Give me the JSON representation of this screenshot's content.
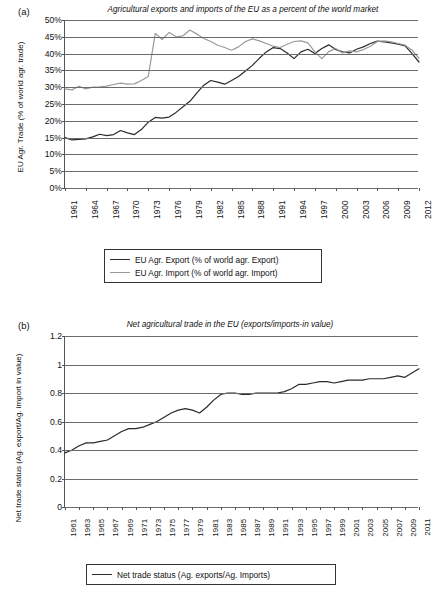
{
  "figure": {
    "panel_a_letter": "(a)",
    "panel_b_letter": "(b)"
  },
  "colors": {
    "export_line": "#2b2b2b",
    "import_line": "#9a9a9a",
    "net_line": "#2b2b2b",
    "grid": "#6b6b6b",
    "axis": "#555555",
    "text": "#111111"
  },
  "panel_a": {
    "title": "Agricultural exports and imports of the EU as a percent of the world market",
    "ylabel": "EU Agr. Trade (% of world agr. trade)",
    "yticks": [
      "50%",
      "45%",
      "40%",
      "35%",
      "30%",
      "25%",
      "20%",
      "15%",
      "10%",
      "5%",
      "0%"
    ],
    "xticks": [
      "1961",
      "1964",
      "1967",
      "1970",
      "1973",
      "1976",
      "1979",
      "1982",
      "1985",
      "1988",
      "1991",
      "1994",
      "1997",
      "2000",
      "2003",
      "2006",
      "2009",
      "2012"
    ],
    "legend": [
      {
        "label": "EU Agr. Export (% of world agr. Export)",
        "style": "dark"
      },
      {
        "label": "EU Agr. Import (% of world agr. Import)",
        "style": "light"
      }
    ]
  },
  "panel_b": {
    "title": "Net agricultural trade in the EU (exports/imports-in value)",
    "ylabel": "Net trade status (Ag. export/Ag. import in value)",
    "yticks": [
      "1.2",
      "1",
      "0.8",
      "0.6",
      "0.4",
      "0.2",
      "0"
    ],
    "xticks": [
      "1961",
      "1963",
      "1965",
      "1967",
      "1969",
      "1971",
      "1973",
      "1975",
      "1977",
      "1979",
      "1981",
      "1983",
      "1985",
      "1987",
      "1989",
      "1991",
      "1993",
      "1995",
      "1997",
      "1999",
      "2001",
      "2003",
      "2005",
      "2007",
      "2009",
      "2011"
    ],
    "legend": [
      {
        "label": "Net trade status (Ag. exports/Ag. Imports)",
        "style": "dark"
      }
    ]
  },
  "chart_data": [
    {
      "type": "line",
      "panel": "(a)",
      "title": "Agricultural exports and imports of the EU as a percent of the world market",
      "xlabel": "",
      "ylabel": "EU Agr. Trade (% of world agr. trade)",
      "ylim": [
        0,
        50
      ],
      "ytick_values": [
        0,
        5,
        10,
        15,
        20,
        25,
        30,
        35,
        40,
        45,
        50
      ],
      "ytick_labels": [
        "0%",
        "5%",
        "10%",
        "15%",
        "20%",
        "25%",
        "30%",
        "35%",
        "40%",
        "45%",
        "50%"
      ],
      "xlim": [
        1961,
        2012
      ],
      "grid": true,
      "legend_position": "below-plot",
      "x": [
        1961,
        1962,
        1963,
        1964,
        1965,
        1966,
        1967,
        1968,
        1969,
        1970,
        1971,
        1972,
        1973,
        1974,
        1975,
        1976,
        1977,
        1978,
        1979,
        1980,
        1981,
        1982,
        1983,
        1984,
        1985,
        1986,
        1987,
        1988,
        1989,
        1990,
        1991,
        1992,
        1993,
        1994,
        1995,
        1996,
        1997,
        1998,
        1999,
        2000,
        2001,
        2002,
        2003,
        2004,
        2005,
        2006,
        2007,
        2008,
        2009,
        2010,
        2011,
        2012
      ],
      "series": [
        {
          "name": "EU Agr. Export (% of world agr. Export)",
          "color": "#2b2b2b",
          "values": [
            15.0,
            14.3,
            14.5,
            14.6,
            15.2,
            16.0,
            15.6,
            15.9,
            17.1,
            16.4,
            15.9,
            17.4,
            19.6,
            21.0,
            20.8,
            21.1,
            22.5,
            24.2,
            25.8,
            28.3,
            30.6,
            32.0,
            31.5,
            30.9,
            32.0,
            33.2,
            34.8,
            36.5,
            38.6,
            40.5,
            41.8,
            41.5,
            40.2,
            38.5,
            40.5,
            41.3,
            40.0,
            41.5,
            42.6,
            41.2,
            40.5,
            40.2,
            41.3,
            42.0,
            43.0,
            43.7,
            43.5,
            43.2,
            42.8,
            42.3,
            40.0,
            37.5
          ]
        },
        {
          "name": "EU Agr. Import (% of world agr. Import)",
          "color": "#9a9a9a",
          "values": [
            29.5,
            29.2,
            30.3,
            29.5,
            30.0,
            30.1,
            30.3,
            30.8,
            31.2,
            30.9,
            31.0,
            32.0,
            33.2,
            46.0,
            44.2,
            46.3,
            45.0,
            45.3,
            47.0,
            45.8,
            44.5,
            43.6,
            42.5,
            41.8,
            41.0,
            42.0,
            43.6,
            44.4,
            43.8,
            43.0,
            42.2,
            41.8,
            42.8,
            43.6,
            43.8,
            43.2,
            40.5,
            38.5,
            40.6,
            41.5,
            40.2,
            40.8,
            40.5,
            41.2,
            42.2,
            43.6,
            43.8,
            43.5,
            43.0,
            42.5,
            41.0,
            38.6
          ]
        }
      ]
    },
    {
      "type": "line",
      "panel": "(b)",
      "title": "Net agricultural trade in the EU (exports/imports-in value)",
      "xlabel": "",
      "ylabel": "Net trade status (Ag. export/Ag. import in value)",
      "ylim": [
        0,
        1.2
      ],
      "ytick_values": [
        0,
        0.2,
        0.4,
        0.6,
        0.8,
        1.0,
        1.2
      ],
      "ytick_labels": [
        "0",
        "0.2",
        "0.4",
        "0.6",
        "0.8",
        "1",
        "1.2"
      ],
      "xlim": [
        1961,
        2011
      ],
      "grid": true,
      "legend_position": "below-plot",
      "x": [
        1961,
        1962,
        1963,
        1964,
        1965,
        1966,
        1967,
        1968,
        1969,
        1970,
        1971,
        1972,
        1973,
        1974,
        1975,
        1976,
        1977,
        1978,
        1979,
        1980,
        1981,
        1982,
        1983,
        1984,
        1985,
        1986,
        1987,
        1988,
        1989,
        1990,
        1991,
        1992,
        1993,
        1994,
        1995,
        1996,
        1997,
        1998,
        1999,
        2000,
        2001,
        2002,
        2003,
        2004,
        2005,
        2006,
        2007,
        2008,
        2009,
        2010,
        2011
      ],
      "series": [
        {
          "name": "Net trade status (Ag. exports/Ag. Imports)",
          "color": "#2b2b2b",
          "values": [
            0.38,
            0.4,
            0.43,
            0.45,
            0.45,
            0.46,
            0.47,
            0.5,
            0.53,
            0.55,
            0.55,
            0.56,
            0.58,
            0.6,
            0.63,
            0.66,
            0.68,
            0.69,
            0.68,
            0.66,
            0.7,
            0.75,
            0.79,
            0.8,
            0.8,
            0.79,
            0.79,
            0.8,
            0.8,
            0.8,
            0.8,
            0.81,
            0.83,
            0.86,
            0.86,
            0.87,
            0.88,
            0.88,
            0.87,
            0.88,
            0.89,
            0.89,
            0.89,
            0.9,
            0.9,
            0.9,
            0.91,
            0.92,
            0.91,
            0.94,
            0.97
          ]
        }
      ]
    }
  ]
}
